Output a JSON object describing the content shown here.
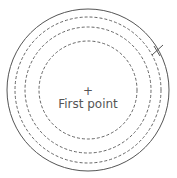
{
  "diagram": {
    "center_marker": "+",
    "center_label": "First point",
    "colors": {
      "stroke": "#555555",
      "background": "#ffffff"
    },
    "circles": [
      {
        "style": "solid",
        "r": 81
      },
      {
        "style": "dashed",
        "r": 73
      },
      {
        "style": "dashed",
        "r": 63
      },
      {
        "style": "dashed",
        "r": 49
      }
    ],
    "marker": {
      "type": "cross-tick",
      "position": "upper-right on outer circle"
    }
  }
}
